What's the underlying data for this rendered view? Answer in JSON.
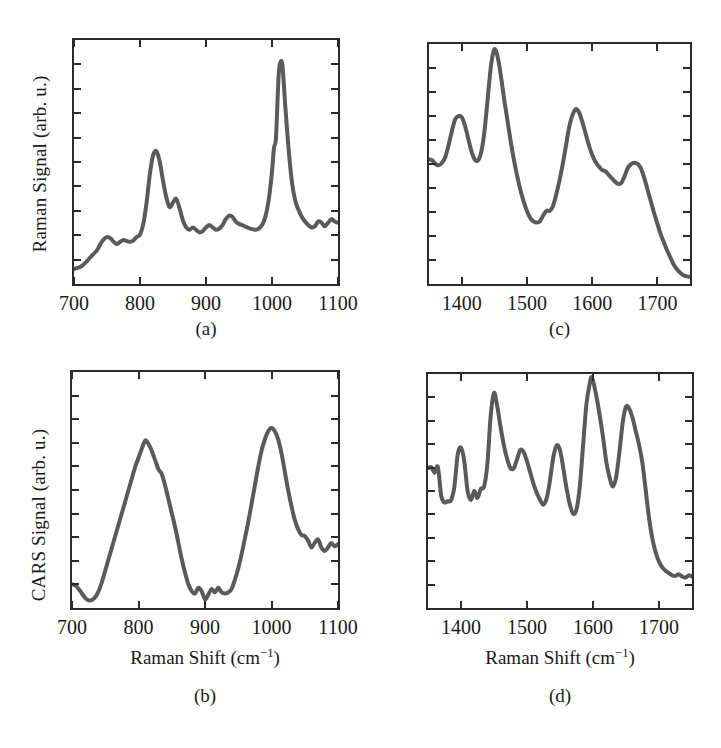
{
  "figure": {
    "background_color": "#ffffff",
    "curve_color": "#5a5a5a",
    "axis_color": "#2b2b2b",
    "panels": [
      "a",
      "b",
      "c",
      "d"
    ]
  },
  "labels": {
    "panel_a": "(a)",
    "panel_b": "(b)",
    "panel_c": "(c)",
    "panel_d": "(d)",
    "raman_signal_axis": "Raman Signal (arb. u.)",
    "cars_signal_axis": "CARS Signal (arb. u.)",
    "raman_shift_axis_pre": "Raman Shift (cm",
    "raman_shift_axis_sup": "−1",
    "raman_shift_axis_post": ")"
  },
  "ticks": {
    "low_range": [
      "700",
      "800",
      "900",
      "1000",
      "1100"
    ],
    "high_range": [
      "1400",
      "1500",
      "1600",
      "1700"
    ]
  },
  "chart_data": [
    {
      "id": "a",
      "type": "line",
      "title": "(a)",
      "xlabel": "Raman Shift (cm-1)",
      "ylabel": "Raman Signal (arb. u.)",
      "xlim": [
        700,
        1100
      ],
      "ylim": [
        0,
        1
      ],
      "xticks": [
        700,
        800,
        900,
        1000,
        1100
      ],
      "yticks_labeled": false,
      "ytick_count": 9,
      "grid": false,
      "legend": "none",
      "annotations": [
        "peak ~825",
        "shoulder ~855",
        "sharp peak ~1003"
      ],
      "x": [
        700,
        705,
        710,
        715,
        720,
        725,
        730,
        735,
        740,
        745,
        750,
        755,
        760,
        765,
        770,
        775,
        780,
        785,
        790,
        795,
        800,
        805,
        810,
        815,
        820,
        825,
        830,
        835,
        840,
        845,
        850,
        855,
        860,
        865,
        870,
        875,
        880,
        885,
        890,
        895,
        900,
        905,
        910,
        915,
        920,
        925,
        930,
        935,
        940,
        945,
        950,
        955,
        960,
        965,
        970,
        975,
        980,
        985,
        990,
        995,
        1000,
        1003,
        1006,
        1010,
        1013,
        1016,
        1020,
        1025,
        1030,
        1035,
        1040,
        1045,
        1050,
        1055,
        1060,
        1065,
        1070,
        1075,
        1080,
        1085,
        1090,
        1095,
        1100
      ],
      "y": [
        0.05,
        0.055,
        0.06,
        0.07,
        0.085,
        0.1,
        0.115,
        0.13,
        0.155,
        0.175,
        0.185,
        0.18,
        0.165,
        0.155,
        0.165,
        0.172,
        0.168,
        0.165,
        0.17,
        0.185,
        0.195,
        0.24,
        0.33,
        0.45,
        0.53,
        0.545,
        0.5,
        0.42,
        0.35,
        0.31,
        0.33,
        0.345,
        0.305,
        0.255,
        0.225,
        0.215,
        0.225,
        0.215,
        0.205,
        0.21,
        0.225,
        0.235,
        0.225,
        0.215,
        0.22,
        0.235,
        0.26,
        0.275,
        0.27,
        0.25,
        0.24,
        0.235,
        0.228,
        0.222,
        0.218,
        0.215,
        0.22,
        0.235,
        0.27,
        0.34,
        0.46,
        0.56,
        0.6,
        0.86,
        0.92,
        0.9,
        0.74,
        0.56,
        0.42,
        0.34,
        0.3,
        0.27,
        0.25,
        0.235,
        0.225,
        0.23,
        0.25,
        0.245,
        0.23,
        0.245,
        0.26,
        0.25,
        0.245,
        0.255
      ]
    },
    {
      "id": "b",
      "type": "line",
      "title": "(b)",
      "xlabel": "Raman Shift (cm-1)",
      "ylabel": "CARS Signal (arb. u.)",
      "xlim": [
        700,
        1100
      ],
      "ylim": [
        0,
        1
      ],
      "xticks": [
        700,
        800,
        900,
        1000,
        1100
      ],
      "yticks_labeled": false,
      "ytick_count": 9,
      "grid": false,
      "legend": "none",
      "annotations": [
        "broad peak ~812",
        "broad peak ~1000"
      ],
      "x": [
        700,
        705,
        710,
        715,
        720,
        725,
        730,
        735,
        740,
        745,
        750,
        755,
        760,
        765,
        770,
        775,
        780,
        785,
        790,
        795,
        800,
        805,
        810,
        815,
        820,
        825,
        830,
        835,
        840,
        845,
        850,
        855,
        860,
        865,
        870,
        875,
        880,
        885,
        890,
        895,
        900,
        905,
        910,
        915,
        920,
        925,
        930,
        935,
        940,
        945,
        950,
        955,
        960,
        965,
        970,
        975,
        980,
        985,
        990,
        995,
        1000,
        1005,
        1010,
        1015,
        1020,
        1025,
        1030,
        1035,
        1040,
        1045,
        1050,
        1055,
        1060,
        1065,
        1070,
        1075,
        1080,
        1085,
        1090,
        1095,
        1100
      ],
      "y": [
        0.09,
        0.085,
        0.07,
        0.05,
        0.03,
        0.02,
        0.022,
        0.035,
        0.06,
        0.1,
        0.15,
        0.2,
        0.25,
        0.3,
        0.35,
        0.4,
        0.45,
        0.5,
        0.55,
        0.6,
        0.64,
        0.68,
        0.715,
        0.7,
        0.67,
        0.63,
        0.59,
        0.57,
        0.52,
        0.46,
        0.4,
        0.34,
        0.27,
        0.2,
        0.14,
        0.09,
        0.06,
        0.05,
        0.075,
        0.06,
        0.025,
        0.045,
        0.07,
        0.055,
        0.075,
        0.055,
        0.05,
        0.055,
        0.07,
        0.11,
        0.16,
        0.22,
        0.29,
        0.36,
        0.44,
        0.52,
        0.6,
        0.67,
        0.72,
        0.755,
        0.77,
        0.755,
        0.72,
        0.66,
        0.58,
        0.5,
        0.43,
        0.37,
        0.33,
        0.305,
        0.3,
        0.28,
        0.25,
        0.27,
        0.285,
        0.25,
        0.235,
        0.25,
        0.27,
        0.255,
        0.265
      ]
    },
    {
      "id": "c",
      "type": "line",
      "title": "(c)",
      "xlabel": "Raman Shift (cm-1)",
      "ylabel": "Raman Signal (arb. u.)",
      "xlim": [
        1350,
        1750
      ],
      "ylim": [
        0,
        1
      ],
      "xticks": [
        1400,
        1500,
        1600,
        1700
      ],
      "yticks_labeled": false,
      "ytick_count": 9,
      "grid": false,
      "legend": "none",
      "annotations": [
        "peak ~1400",
        "max peak ~1450",
        "peak ~1575",
        "shoulder ~1660"
      ],
      "x": [
        1350,
        1355,
        1360,
        1365,
        1370,
        1375,
        1380,
        1385,
        1390,
        1395,
        1400,
        1405,
        1410,
        1415,
        1420,
        1425,
        1430,
        1435,
        1440,
        1445,
        1450,
        1455,
        1460,
        1465,
        1470,
        1475,
        1480,
        1485,
        1490,
        1495,
        1500,
        1505,
        1510,
        1515,
        1520,
        1525,
        1530,
        1535,
        1540,
        1545,
        1550,
        1555,
        1560,
        1565,
        1570,
        1575,
        1580,
        1585,
        1590,
        1595,
        1600,
        1605,
        1610,
        1615,
        1620,
        1625,
        1630,
        1635,
        1640,
        1645,
        1650,
        1655,
        1660,
        1665,
        1670,
        1675,
        1680,
        1685,
        1690,
        1695,
        1700,
        1705,
        1710,
        1715,
        1720,
        1725,
        1730,
        1735,
        1740,
        1745,
        1750
      ],
      "y": [
        0.52,
        0.515,
        0.5,
        0.495,
        0.505,
        0.53,
        0.58,
        0.64,
        0.69,
        0.705,
        0.7,
        0.665,
        0.61,
        0.555,
        0.52,
        0.515,
        0.55,
        0.64,
        0.78,
        0.92,
        0.99,
        0.96,
        0.88,
        0.78,
        0.69,
        0.6,
        0.52,
        0.45,
        0.39,
        0.34,
        0.3,
        0.27,
        0.255,
        0.25,
        0.255,
        0.28,
        0.3,
        0.3,
        0.32,
        0.37,
        0.43,
        0.5,
        0.58,
        0.66,
        0.71,
        0.735,
        0.72,
        0.68,
        0.63,
        0.58,
        0.54,
        0.51,
        0.49,
        0.475,
        0.47,
        0.455,
        0.44,
        0.425,
        0.415,
        0.42,
        0.45,
        0.485,
        0.5,
        0.505,
        0.5,
        0.48,
        0.44,
        0.39,
        0.34,
        0.29,
        0.245,
        0.2,
        0.165,
        0.13,
        0.1,
        0.07,
        0.05,
        0.035,
        0.025,
        0.02,
        0.018
      ]
    },
    {
      "id": "d",
      "type": "line",
      "title": "(d)",
      "xlabel": "Raman Shift (cm-1)",
      "ylabel": "CARS Signal (arb. u.)",
      "xlim": [
        1350,
        1750
      ],
      "ylim": [
        0,
        1
      ],
      "xticks": [
        1400,
        1500,
        1600,
        1700
      ],
      "yticks_labeled": false,
      "ytick_count": 9,
      "grid": false,
      "legend": "none",
      "annotations": [
        "peak ~1400",
        "peak ~1450",
        "peak ~1490",
        "peak ~1555",
        "max peak ~1598",
        "peak ~1650"
      ],
      "x": [
        1350,
        1355,
        1360,
        1365,
        1370,
        1375,
        1380,
        1385,
        1390,
        1395,
        1400,
        1405,
        1410,
        1415,
        1420,
        1425,
        1430,
        1435,
        1440,
        1445,
        1450,
        1455,
        1460,
        1465,
        1470,
        1475,
        1480,
        1485,
        1490,
        1495,
        1500,
        1505,
        1510,
        1515,
        1520,
        1525,
        1530,
        1535,
        1540,
        1545,
        1550,
        1555,
        1560,
        1565,
        1570,
        1575,
        1580,
        1585,
        1590,
        1595,
        1598,
        1602,
        1608,
        1615,
        1620,
        1625,
        1630,
        1635,
        1640,
        1645,
        1650,
        1655,
        1660,
        1665,
        1670,
        1675,
        1680,
        1685,
        1690,
        1695,
        1700,
        1705,
        1710,
        1715,
        1720,
        1725,
        1730,
        1735,
        1740,
        1745,
        1750
      ],
      "y": [
        0.6,
        0.605,
        0.58,
        0.605,
        0.48,
        0.45,
        0.455,
        0.46,
        0.52,
        0.66,
        0.69,
        0.63,
        0.5,
        0.46,
        0.5,
        0.47,
        0.51,
        0.52,
        0.62,
        0.83,
        0.93,
        0.87,
        0.78,
        0.7,
        0.64,
        0.6,
        0.6,
        0.64,
        0.68,
        0.67,
        0.63,
        0.58,
        0.53,
        0.49,
        0.46,
        0.44,
        0.47,
        0.55,
        0.65,
        0.7,
        0.68,
        0.6,
        0.51,
        0.44,
        0.4,
        0.42,
        0.52,
        0.7,
        0.88,
        0.97,
        1.0,
        0.96,
        0.87,
        0.74,
        0.63,
        0.56,
        0.52,
        0.56,
        0.67,
        0.8,
        0.87,
        0.86,
        0.82,
        0.76,
        0.7,
        0.62,
        0.5,
        0.38,
        0.29,
        0.23,
        0.19,
        0.165,
        0.15,
        0.14,
        0.13,
        0.128,
        0.135,
        0.125,
        0.12,
        0.13,
        0.125
      ]
    }
  ]
}
